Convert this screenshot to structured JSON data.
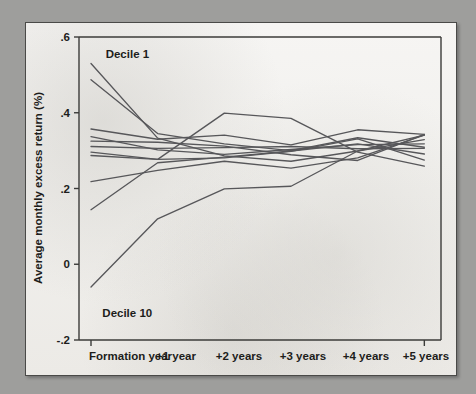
{
  "chart_data": {
    "type": "line",
    "title": "",
    "xlabel": "",
    "ylabel": "Average monthly excess return (%)",
    "categories": [
      "Formation year",
      "+1 year",
      "+2 years",
      "+3 years",
      "+4 years",
      "+5 years"
    ],
    "x": [
      0,
      1,
      2,
      3,
      4,
      5
    ],
    "ylim": [
      -0.2,
      0.6
    ],
    "xlim": [
      -0.18,
      5.25
    ],
    "yticks": [
      -0.2,
      0,
      0.2,
      0.4,
      0.6
    ],
    "ytick_labels": [
      "-.2",
      "0",
      ".2",
      ".4",
      ".6"
    ],
    "grid": false,
    "legend": "none",
    "annotations": [
      {
        "text": "Decile 1",
        "x": 0.22,
        "y": 0.555
      },
      {
        "text": "Decile 10",
        "x": 0.17,
        "y": -0.128
      }
    ],
    "series": [
      {
        "name": "Decile 1",
        "values": [
          0.53,
          0.333,
          0.286,
          0.272,
          0.299,
          0.341
        ]
      },
      {
        "name": "Decile 2",
        "values": [
          0.487,
          0.345,
          0.318,
          0.3,
          0.334,
          0.309
        ]
      },
      {
        "name": "Decile 3",
        "values": [
          0.357,
          0.33,
          0.341,
          0.315,
          0.355,
          0.343
        ]
      },
      {
        "name": "Decile 4",
        "values": [
          0.337,
          0.302,
          0.29,
          0.303,
          0.316,
          0.318
        ]
      },
      {
        "name": "Decile 5",
        "values": [
          0.325,
          0.322,
          0.312,
          0.289,
          0.274,
          0.343
        ]
      },
      {
        "name": "Decile 6",
        "values": [
          0.311,
          0.306,
          0.308,
          0.311,
          0.305,
          0.306
        ]
      },
      {
        "name": "Decile 7",
        "values": [
          0.296,
          0.277,
          0.281,
          0.298,
          0.331,
          0.275
        ]
      },
      {
        "name": "Decile 8",
        "values": [
          0.287,
          0.277,
          0.399,
          0.385,
          0.296,
          0.259
        ]
      },
      {
        "name": "Decile 9",
        "values": [
          0.218,
          0.248,
          0.272,
          0.254,
          0.281,
          0.341
        ]
      },
      {
        "name": "Decile 10",
        "values": [
          0.144,
          0.268,
          0.283,
          0.299,
          0.318,
          0.291
        ]
      },
      {
        "name": "Decile 10 low",
        "values": [
          -0.06,
          0.12,
          0.199,
          0.206,
          0.299,
          0.329
        ]
      }
    ]
  },
  "figure": {
    "axis_color": "#3b3b39",
    "line_color": "#57575a",
    "paper_color": "#f4f3f1",
    "background_color": "#9e9e9c"
  }
}
